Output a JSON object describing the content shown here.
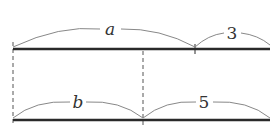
{
  "diagram": {
    "top_segments": [
      {
        "label": "a",
        "style": "italic"
      },
      {
        "label": "3",
        "style": "normal"
      }
    ],
    "bottom_segments": [
      {
        "label": "b",
        "style": "italic"
      },
      {
        "label": "5",
        "style": "normal"
      }
    ],
    "colors": {
      "line": "#2a2a2a",
      "arc": "#888888",
      "dashed": "#555555"
    }
  }
}
